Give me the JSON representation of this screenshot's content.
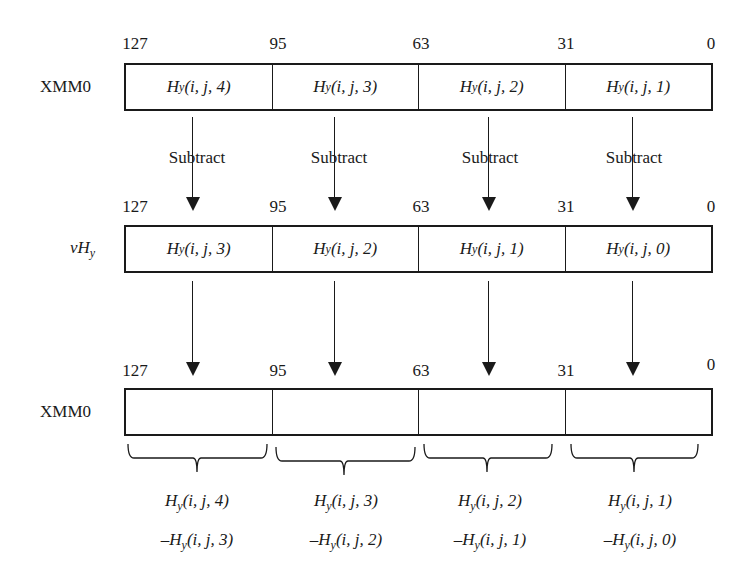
{
  "diagram": {
    "type": "SIMD register subtraction",
    "bit_positions": [
      "127",
      "95",
      "63",
      "31",
      "0"
    ],
    "operation_label": "Subtract",
    "rows": [
      {
        "label": "XMM0",
        "label_italic": false,
        "cells": [
          {
            "base": "H",
            "sub": "y",
            "args": "(i, j, 4)"
          },
          {
            "base": "H",
            "sub": "y",
            "args": "(i, j, 3)"
          },
          {
            "base": "H",
            "sub": "y",
            "args": "(i, j, 2)"
          },
          {
            "base": "H",
            "sub": "y",
            "args": "(i, j, 1)"
          }
        ]
      },
      {
        "label_prefix": "vH",
        "label_sub": "y",
        "label_italic": true,
        "cells": [
          {
            "base": "H",
            "sub": "y",
            "args": "(i, j, 3)"
          },
          {
            "base": "H",
            "sub": "y",
            "args": "(i, j, 2)"
          },
          {
            "base": "H",
            "sub": "y",
            "args": "(i, j, 1)"
          },
          {
            "base": "H",
            "sub": "y",
            "args": "(i, j, 0)"
          }
        ]
      },
      {
        "label": "XMM0",
        "label_italic": false,
        "cells": [
          {
            "base": "",
            "sub": "",
            "args": ""
          },
          {
            "base": "",
            "sub": "",
            "args": ""
          },
          {
            "base": "",
            "sub": "",
            "args": ""
          },
          {
            "base": "",
            "sub": "",
            "args": ""
          }
        ]
      }
    ],
    "results": [
      {
        "line1": {
          "base": "H",
          "sub": "y",
          "args": "(i, j, 4)"
        },
        "line2": {
          "prefix": "–H",
          "sub": "y",
          "args": "(i, j, 3)"
        }
      },
      {
        "line1": {
          "base": "H",
          "sub": "y",
          "args": "(i, j, 3)"
        },
        "line2": {
          "prefix": "–H",
          "sub": "y",
          "args": "(i, j, 2)"
        }
      },
      {
        "line1": {
          "base": "H",
          "sub": "y",
          "args": "(i, j, 2)"
        },
        "line2": {
          "prefix": "–H",
          "sub": "y",
          "args": "(i, j, 1)"
        }
      },
      {
        "line1": {
          "base": "H",
          "sub": "y",
          "args": "(i, j, 1)"
        },
        "line2": {
          "prefix": "–H",
          "sub": "y",
          "args": "(i, j, 0)"
        }
      }
    ]
  }
}
